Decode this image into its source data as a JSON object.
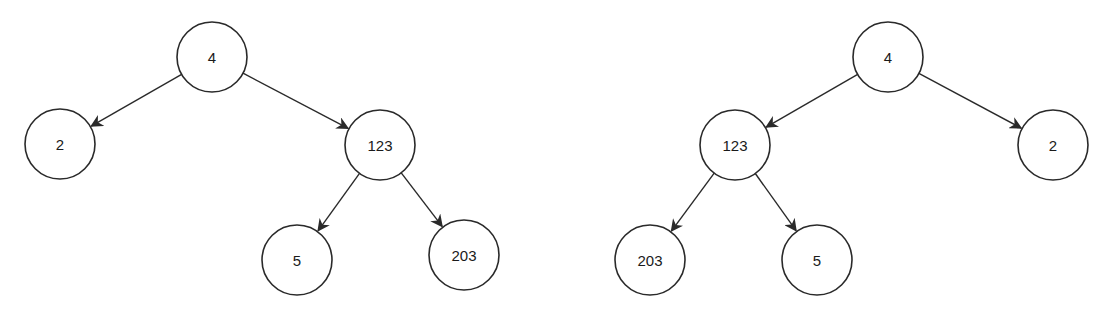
{
  "diagram": {
    "type": "binary-tree-pair",
    "colors": {
      "stroke": "#2a2a2a",
      "fill": "#ffffff",
      "text": "#1a1a1a"
    },
    "trees": [
      {
        "name": "original-tree",
        "nodes": [
          {
            "id": "L0",
            "label": "4",
            "x": 212,
            "y": 57
          },
          {
            "id": "L1",
            "label": "2",
            "x": 60,
            "y": 144
          },
          {
            "id": "L2",
            "label": "123",
            "x": 380,
            "y": 145
          },
          {
            "id": "L3",
            "label": "5",
            "x": 297,
            "y": 260
          },
          {
            "id": "L4",
            "label": "203",
            "x": 464,
            "y": 255
          }
        ],
        "edges": [
          {
            "from": "L0",
            "to": "L1"
          },
          {
            "from": "L0",
            "to": "L2"
          },
          {
            "from": "L2",
            "to": "L3"
          },
          {
            "from": "L2",
            "to": "L4"
          }
        ]
      },
      {
        "name": "mirrored-tree",
        "nodes": [
          {
            "id": "R0",
            "label": "4",
            "x": 888,
            "y": 57
          },
          {
            "id": "R1",
            "label": "123",
            "x": 735,
            "y": 145
          },
          {
            "id": "R2",
            "label": "2",
            "x": 1053,
            "y": 145
          },
          {
            "id": "R3",
            "label": "203",
            "x": 650,
            "y": 260
          },
          {
            "id": "R4",
            "label": "5",
            "x": 817,
            "y": 260
          }
        ],
        "edges": [
          {
            "from": "R0",
            "to": "R1"
          },
          {
            "from": "R0",
            "to": "R2"
          },
          {
            "from": "R1",
            "to": "R3"
          },
          {
            "from": "R1",
            "to": "R4"
          }
        ]
      }
    ]
  }
}
